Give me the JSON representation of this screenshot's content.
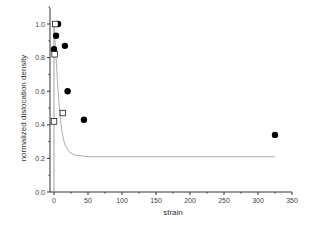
{
  "chart_data": {
    "type": "scatter",
    "title": "",
    "xlabel": "strain",
    "ylabel": "normalized dislocation density",
    "xlim": [
      0,
      350
    ],
    "ylim": [
      0.0,
      1.1
    ],
    "xticks": [
      0,
      50,
      100,
      150,
      200,
      250,
      300,
      350
    ],
    "xtick_labels": [
      "0",
      "50",
      "100",
      "150",
      "200",
      "250",
      "300",
      "350"
    ],
    "yticks": [
      0.0,
      0.2,
      0.4,
      0.6,
      0.8,
      1.0
    ],
    "ytick_labels": [
      "0.0",
      "0.2",
      "0.4",
      "0.6",
      "0.8",
      "1.0"
    ],
    "grid": false,
    "legend": null,
    "series": [
      {
        "name": "filled circles",
        "marker": "filled-circle",
        "color": "#000000",
        "points": [
          [
            6,
            1.0
          ],
          [
            3,
            0.93
          ],
          [
            0,
            0.85
          ],
          [
            16,
            0.87
          ],
          [
            20,
            0.6
          ],
          [
            44,
            0.43
          ],
          [
            325,
            0.34
          ]
        ]
      },
      {
        "name": "open squares",
        "marker": "open-square",
        "color": "#000000",
        "points": [
          [
            2,
            1.0
          ],
          [
            1,
            0.82
          ],
          [
            0,
            0.42
          ],
          [
            13,
            0.47
          ]
        ]
      },
      {
        "name": "fit curve",
        "type": "line",
        "color": "#999999",
        "points": [
          [
            0,
            1.0
          ],
          [
            3,
            0.8
          ],
          [
            6,
            0.6
          ],
          [
            9,
            0.45
          ],
          [
            12,
            0.35
          ],
          [
            16,
            0.28
          ],
          [
            22,
            0.24
          ],
          [
            30,
            0.22
          ],
          [
            50,
            0.21
          ],
          [
            100,
            0.21
          ],
          [
            200,
            0.21
          ],
          [
            300,
            0.21
          ],
          [
            325,
            0.21
          ]
        ]
      }
    ]
  }
}
